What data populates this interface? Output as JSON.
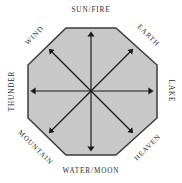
{
  "diagram": {
    "shape": "octagon",
    "fill_color": "#c8c8c8",
    "stroke_color": "#3b3b3b",
    "arrow_color": "#1a1a1a",
    "text_color": "#2b2b2b",
    "background_color": "#ffffff",
    "arrow_count": 8,
    "arrow_direction": "outward-from-center",
    "labels": {
      "north": "SUN/FIRE",
      "northeast": "EARTH",
      "east": "LAKE",
      "southeast": "HEAVEN",
      "south": "WATER/MOON",
      "southwest": "MOUNTAIN",
      "west": "THUNDER",
      "northwest": "WIND"
    }
  }
}
